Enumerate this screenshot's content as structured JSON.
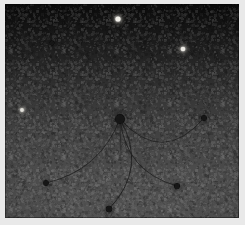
{
  "figure": {
    "title": "",
    "kind": "astronomical-field-image",
    "canvas": {
      "width": 245,
      "height": 225
    },
    "plate": {
      "x": 5,
      "y": 4,
      "width": 234,
      "height": 214
    },
    "border_color": "#e9e9e9"
  },
  "background": {
    "type": "vertical-gradient",
    "top_color": "#0b0b0b",
    "upper_mid_color": "#1c1c1c",
    "mid_color": "#3a3a3a",
    "lower_mid_color": "#4b4b4b",
    "bottom_color": "#535353",
    "noise": "film-grain",
    "noise_opacity": 0.4
  },
  "chart_data": {
    "type": "scatter",
    "title": "",
    "xlabel": "",
    "ylabel": "",
    "xlim": [
      0,
      234
    ],
    "ylim": [
      0,
      214
    ],
    "grid": false,
    "legend": "none",
    "series": [
      {
        "name": "bright sources",
        "marker": "point",
        "color": "#f2f0ea",
        "points": [
          {
            "label": "S1",
            "x": 113,
            "y": 15,
            "radius": 2.6,
            "brightness": 1.0
          },
          {
            "label": "S2",
            "x": 178,
            "y": 45,
            "radius": 2.3,
            "brightness": 0.92
          },
          {
            "label": "S3",
            "x": 17,
            "y": 106,
            "radius": 1.9,
            "brightness": 0.72
          }
        ]
      },
      {
        "name": "dark sources",
        "marker": "point",
        "color": "#121212",
        "points": [
          {
            "label": "D0",
            "x": 115,
            "y": 115,
            "radius": 5.0,
            "brightness": 0.02,
            "role": "core"
          },
          {
            "label": "D1",
            "x": 199,
            "y": 114,
            "radius": 3.0,
            "brightness": 0.05
          },
          {
            "label": "D2",
            "x": 41,
            "y": 179,
            "radius": 2.9,
            "brightness": 0.05
          },
          {
            "label": "D3",
            "x": 104,
            "y": 205,
            "radius": 3.2,
            "brightness": 0.04
          },
          {
            "label": "D4",
            "x": 172,
            "y": 182,
            "radius": 3.1,
            "brightness": 0.05
          },
          {
            "label": "D5",
            "x": 47,
            "y": 39,
            "radius": 2.4,
            "brightness": 0.03
          }
        ]
      }
    ],
    "arcs": [
      {
        "label": "A1",
        "from": "D0",
        "to": "D1",
        "sag": 48,
        "stroke": "#1e1e1e",
        "width": 0.9
      },
      {
        "label": "A2",
        "from": "D0",
        "to": "D4",
        "sag": 30,
        "stroke": "#1e1e1e",
        "width": 0.9
      },
      {
        "label": "A3",
        "from": "D0",
        "to": "D3",
        "sag": -34,
        "stroke": "#1e1e1e",
        "width": 1.0
      },
      {
        "label": "A4",
        "from": "D0",
        "to": "D2",
        "sag": -26,
        "stroke": "#1e1e1e",
        "width": 0.9
      },
      {
        "label": "A5",
        "from": "D0",
        "to": "core-spur",
        "sag": 0,
        "stroke": "#232323",
        "width": 0.8
      }
    ],
    "annotations": []
  }
}
